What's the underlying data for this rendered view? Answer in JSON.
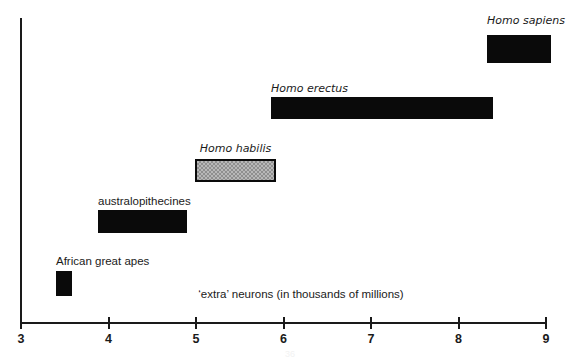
{
  "chart_data": {
    "type": "bar",
    "orientation": "horizontal-range",
    "title": "",
    "xlabel": "‘extra’ neurons (in thousands of millions)",
    "ylabel": "",
    "xlim": [
      3,
      9
    ],
    "xticks": [
      3,
      4,
      5,
      6,
      7,
      8,
      9
    ],
    "xtick_labels": [
      "3",
      "4",
      "5",
      "6",
      "7",
      "8",
      "9"
    ],
    "grid": false,
    "legend": "none",
    "categories": [
      "Homo sapiens",
      "Homo erectus",
      "Homo habilis",
      "australopithecines",
      "African great apes"
    ],
    "bars": [
      {
        "label": "Homo sapiens",
        "italic": true,
        "x_start": 8.33,
        "x_end": 9.06,
        "fill": "solid-black",
        "label_align": "center",
        "px": {
          "left": 487,
          "right": 551,
          "top": 35,
          "bottom": 63,
          "label_top": 14
        }
      },
      {
        "label": "Homo erectus",
        "italic": true,
        "x_start": 5.86,
        "x_end": 8.4,
        "fill": "solid-black",
        "label_align": "left",
        "px": {
          "left": 271,
          "right": 493,
          "top": 97,
          "bottom": 119,
          "label_top": 82
        }
      },
      {
        "label": "Homo habilis",
        "italic": true,
        "x_start": 4.99,
        "x_end": 5.91,
        "fill": "stippled-gray",
        "label_align": "center",
        "px": {
          "left": 195,
          "right": 276,
          "top": 159,
          "bottom": 182,
          "label_top": 142
        }
      },
      {
        "label": "australopithecines",
        "italic": false,
        "x_start": 3.88,
        "x_end": 4.9,
        "fill": "solid-black",
        "label_align": "left",
        "px": {
          "left": 98,
          "right": 187,
          "top": 210,
          "bottom": 233,
          "label_top": 195
        }
      },
      {
        "label": "African great apes",
        "italic": false,
        "x_start": 3.4,
        "x_end": 3.58,
        "fill": "solid-black",
        "label_align": "left",
        "px": {
          "left": 56,
          "right": 72,
          "top": 271,
          "bottom": 296,
          "label_top": 255
        }
      }
    ],
    "colors": {
      "axis": "#1a1a1a",
      "bar_solid": "#0a0a0a",
      "bar_hatched_fill": "#b8b8b8",
      "bar_hatched_border": "#0a0a0a",
      "background": "#ffffff",
      "text": "#1a1a1a"
    }
  },
  "axis": {
    "x_title": "‘extra’ neurons (in thousands of millions)",
    "ticks": [
      {
        "label": "3",
        "value": 3
      },
      {
        "label": "4",
        "value": 4
      },
      {
        "label": "5",
        "value": 5
      },
      {
        "label": "6",
        "value": 6
      },
      {
        "label": "7",
        "value": 7
      },
      {
        "label": "8",
        "value": 8
      },
      {
        "label": "9",
        "value": 9
      }
    ]
  },
  "page": {
    "page_number": "36"
  }
}
